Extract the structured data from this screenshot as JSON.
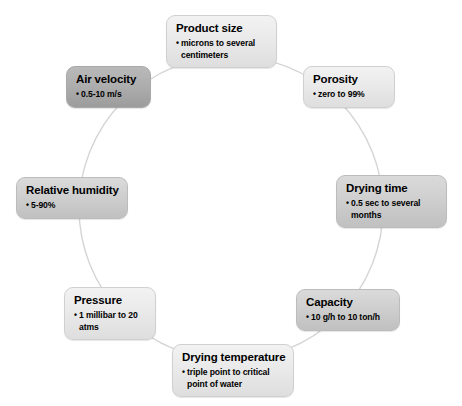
{
  "diagram": {
    "type": "cycle",
    "shape": "circle-ring",
    "ring": {
      "center_x": 231,
      "center_y": 208,
      "radius": 152,
      "stroke_color": "#d5d5d5",
      "stroke_width": 1.4
    },
    "background_color": "#ffffff",
    "node_fill_light": "#eaeaea",
    "node_fill_mid": "#cfcfcf",
    "node_fill_dark": "#aeaeae",
    "node_border_color": "#c9c9c9",
    "text_color": "#000000",
    "nodes": [
      {
        "id": "product-size",
        "title": "Product size",
        "bullets": [
          "microns to several centimeters"
        ],
        "shade": "shade-light",
        "position": "top"
      },
      {
        "id": "porosity",
        "title": "Porosity",
        "bullets": [
          "zero to 99%"
        ],
        "shade": "shade-light",
        "position": "top-right"
      },
      {
        "id": "drying-time",
        "title": "Drying time",
        "bullets": [
          "0.5 sec to several months"
        ],
        "shade": "shade-mid",
        "position": "right"
      },
      {
        "id": "capacity",
        "title": "Capacity",
        "bullets": [
          "10 g/h to 10 ton/h"
        ],
        "shade": "shade-mid",
        "position": "bottom-right"
      },
      {
        "id": "drying-temperature",
        "title": "Drying temperature",
        "bullets": [
          "triple point to critical point of water"
        ],
        "shade": "shade-light",
        "position": "bottom"
      },
      {
        "id": "pressure",
        "title": "Pressure",
        "bullets": [
          "1 millibar to 20 atms"
        ],
        "shade": "shade-light",
        "position": "bottom-left"
      },
      {
        "id": "relative-humidity",
        "title": "Relative humidity",
        "bullets": [
          "5-90%"
        ],
        "shade": "shade-mid",
        "position": "left"
      },
      {
        "id": "air-velocity",
        "title": "Air velocity",
        "bullets": [
          "0.5-10 m/s"
        ],
        "shade": "shade-dark",
        "position": "top-left"
      }
    ]
  }
}
